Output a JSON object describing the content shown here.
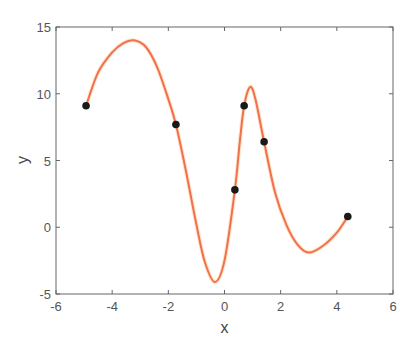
{
  "chart_data": {
    "type": "line",
    "title": "",
    "xlabel": "x",
    "ylabel": "y",
    "xlim": [
      -6,
      6
    ],
    "ylim": [
      -5,
      15
    ],
    "xticks": [
      -6,
      -4,
      -2,
      0,
      2,
      4,
      6
    ],
    "yticks": [
      -5,
      0,
      5,
      10,
      15
    ],
    "xtick_labels": [
      "-6",
      "-4",
      "-2",
      "0",
      "2",
      "4",
      "6"
    ],
    "ytick_labels": [
      "-5",
      "0",
      "5",
      "10",
      "15"
    ],
    "grid": false,
    "legend": null,
    "series": [
      {
        "name": "interpolating curve",
        "type": "line",
        "color": "#f07050",
        "x": [
          -4.93,
          -4.5,
          -4.0,
          -3.6,
          -3.22,
          -2.8,
          -2.4,
          -2.0,
          -1.73,
          -1.4,
          -1.0,
          -0.7,
          -0.34,
          0.0,
          0.37,
          0.55,
          0.7,
          0.91,
          1.1,
          1.41,
          1.8,
          2.2,
          2.6,
          3.0,
          3.5,
          4.0,
          4.39
        ],
        "y": [
          9.1,
          11.6,
          13.1,
          13.8,
          14.0,
          13.5,
          12.0,
          9.6,
          7.7,
          4.5,
          0.2,
          -2.6,
          -4.1,
          -2.5,
          2.8,
          6.5,
          9.1,
          10.5,
          9.6,
          6.4,
          2.6,
          0.2,
          -1.3,
          -1.9,
          -1.4,
          -0.4,
          0.8
        ]
      },
      {
        "name": "data points",
        "type": "scatter",
        "color": "#1a1a1a",
        "x": [
          -4.93,
          -1.73,
          0.37,
          0.7,
          1.41,
          4.39
        ],
        "y": [
          9.1,
          7.7,
          2.8,
          9.1,
          6.4,
          0.8
        ]
      }
    ]
  },
  "colors": {
    "curve": "#f07050",
    "marker": "#1a1a1a",
    "axes": "#666666",
    "text": "#555555"
  }
}
